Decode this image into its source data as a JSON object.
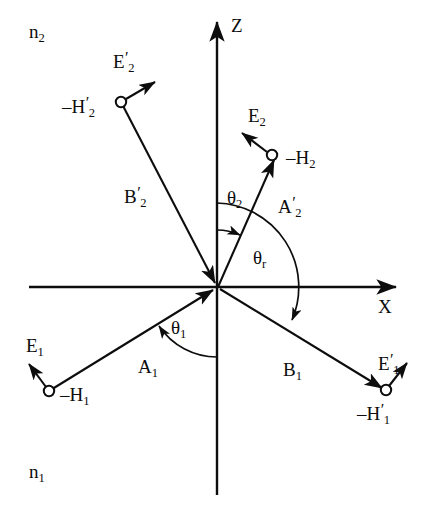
{
  "figure": {
    "width": 436,
    "height": 522,
    "background": "#ffffff",
    "stroke_color": "#0d0d0d"
  },
  "axes": {
    "z_label": "Z",
    "x_label": "X",
    "origin": {
      "x": 218,
      "y": 287
    }
  },
  "media": [
    {
      "key": "upper",
      "label_text": "n",
      "label_sub": "2",
      "region": "above interface"
    },
    {
      "key": "lower",
      "label_text": "n",
      "label_sub": "1",
      "region": "below interface"
    }
  ],
  "rays": [
    {
      "name": "incident-ray",
      "label_text": "A",
      "label_sub": "1",
      "label_prime": "",
      "from": {
        "x": 49,
        "y": 391
      },
      "to": {
        "x": 218,
        "y": 287
      },
      "arrow_at": "end"
    },
    {
      "name": "reflected-ray",
      "label_text": "B",
      "label_sub": "1",
      "label_prime": "",
      "from": {
        "x": 218,
        "y": 287
      },
      "to": {
        "x": 386,
        "y": 390
      },
      "arrow_at": "end"
    },
    {
      "name": "transmitted-ray",
      "label_text": "A",
      "label_sub": "2",
      "label_prime": "′",
      "from": {
        "x": 218,
        "y": 287
      },
      "to": {
        "x": 272,
        "y": 155
      },
      "arrow_at": "end"
    },
    {
      "name": "incoming-upper-ray",
      "label_text": "B",
      "label_sub": "2",
      "label_prime": "′",
      "from": {
        "x": 121,
        "y": 102
      },
      "to": {
        "x": 218,
        "y": 287
      },
      "arrow_at": "end"
    }
  ],
  "field_points": [
    {
      "name": "field-point-h1",
      "circle": {
        "x": 49,
        "y": 391
      },
      "h_label_text": "–H",
      "h_label_sub": "1",
      "h_label_prime": "",
      "e_label_text": "E",
      "e_label_sub": "1",
      "e_label_prime": "",
      "e_arrow_to": {
        "x": 26,
        "y": 360
      }
    },
    {
      "name": "field-point-h1-prime",
      "circle": {
        "x": 386,
        "y": 390
      },
      "h_label_text": "–H",
      "h_label_sub": "1",
      "h_label_prime": "′",
      "e_label_text": "E",
      "e_label_sub": "1",
      "e_label_prime": "′",
      "e_arrow_to": {
        "x": 410,
        "y": 360
      }
    },
    {
      "name": "field-point-h2",
      "circle": {
        "x": 272,
        "y": 155
      },
      "h_label_text": "–H",
      "h_label_sub": "2",
      "h_label_prime": "",
      "e_label_text": "E",
      "e_label_sub": "2",
      "e_label_prime": "",
      "e_arrow_to": {
        "x": 239,
        "y": 130
      }
    },
    {
      "name": "field-point-h2-prime",
      "circle": {
        "x": 121,
        "y": 102
      },
      "h_label_text": "–H",
      "h_label_sub": "2",
      "h_label_prime": "′",
      "e_label_text": "E",
      "e_label_sub": "2",
      "e_label_prime": "′",
      "e_arrow_to": {
        "x": 158,
        "y": 79
      }
    }
  ],
  "angles": [
    {
      "name": "angle-theta-1",
      "symbol": "θ",
      "sub": "1",
      "description": "angle of incidence measured from negative Z axis to incident ray A1",
      "radius": 68
    },
    {
      "name": "angle-theta-2",
      "symbol": "θ",
      "sub": "2",
      "description": "angle of refraction measured from positive Z axis to transmitted ray A2 prime",
      "radius": 57
    },
    {
      "name": "angle-theta-r",
      "symbol": "θ",
      "sub": "r",
      "description": "reflection angle measured from positive Z axis clockwise to reflected ray B1",
      "radius": 84
    }
  ],
  "labels": {
    "n2": {
      "base": "n",
      "sub": "2"
    },
    "n1": {
      "base": "n",
      "sub": "1"
    },
    "z": "Z",
    "x": "X",
    "a1": {
      "base": "A",
      "sub": "1",
      "prime": ""
    },
    "b1": {
      "base": "B",
      "sub": "1",
      "prime": ""
    },
    "a2p": {
      "base": "A",
      "sub": "2",
      "prime": "′"
    },
    "b2p": {
      "base": "B",
      "sub": "2",
      "prime": "′"
    },
    "e1": {
      "base": "E",
      "sub": "1",
      "prime": ""
    },
    "e1p": {
      "base": "E",
      "sub": "1",
      "prime": "′"
    },
    "e2": {
      "base": "E",
      "sub": "2",
      "prime": ""
    },
    "e2p": {
      "base": "E",
      "sub": "2",
      "prime": "′"
    },
    "h1": {
      "base": "–H",
      "sub": "1",
      "prime": ""
    },
    "h1p": {
      "base": "–H",
      "sub": "1",
      "prime": "′"
    },
    "h2": {
      "base": "–H",
      "sub": "2",
      "prime": ""
    },
    "h2p": {
      "base": "–H",
      "sub": "2",
      "prime": "′"
    },
    "theta1": {
      "base": "θ",
      "sub": "1"
    },
    "theta2": {
      "base": "θ",
      "sub": "2"
    },
    "thetar": {
      "base": "θ",
      "sub": "r"
    }
  }
}
